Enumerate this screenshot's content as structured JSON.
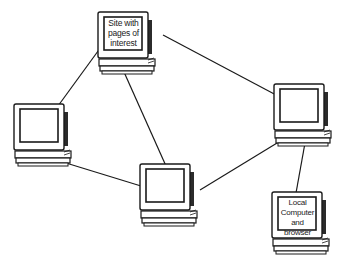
{
  "diagram": {
    "type": "network",
    "colors": {
      "line": "#1a1a1a",
      "background": "#ffffff",
      "screen": "#ffffff",
      "case_shade": "#2b2b2b"
    },
    "nodes": [
      {
        "id": "site",
        "label": "Site with pages of interest",
        "label_lines": [
          "Site with",
          "pages of",
          "interest"
        ],
        "icon": "computer-icon",
        "x": 96,
        "y": 10
      },
      {
        "id": "left",
        "label": "",
        "icon": "computer-icon",
        "x": 12,
        "y": 102
      },
      {
        "id": "center",
        "label": "",
        "icon": "computer-icon",
        "x": 138,
        "y": 162
      },
      {
        "id": "right",
        "label": "",
        "icon": "computer-icon",
        "x": 272,
        "y": 82
      },
      {
        "id": "local",
        "label": "Local Computer and browser",
        "label_lines": [
          "Local",
          "Computer",
          "and browser"
        ],
        "icon": "computer-icon",
        "x": 270,
        "y": 190
      }
    ],
    "edges": [
      {
        "from": "site",
        "to": "left"
      },
      {
        "from": "site",
        "to": "right"
      },
      {
        "from": "site",
        "to": "center"
      },
      {
        "from": "left",
        "to": "center"
      },
      {
        "from": "center",
        "to": "right"
      },
      {
        "from": "right",
        "to": "local"
      }
    ]
  }
}
